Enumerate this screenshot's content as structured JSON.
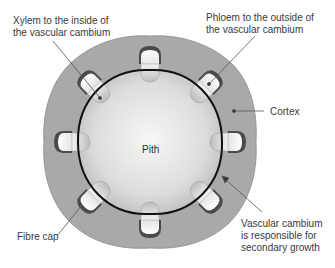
{
  "diagram": {
    "labels": {
      "xylem": [
        "Xylem to the inside of",
        "the vascular cambium"
      ],
      "phloem": [
        "Phloem to the outside of",
        "the vascular cambium"
      ],
      "cortex": "Cortex",
      "pith": "Pith",
      "cambium": [
        "Vascular cambium",
        "is responsible for",
        "secondary growth"
      ],
      "fibre_cap": "Fibre cap"
    },
    "colors": {
      "cortex": "#a9a9a9",
      "pith_center": "#f4f4f4",
      "pith_edge": "#b8b8b8",
      "cambium_ring": "#111111",
      "fibre_cap": "#4a4a4a",
      "phloem": "#f2f2f2",
      "xylem": "#d0d0d0",
      "leader": "#555555"
    },
    "vascular_bundle_count": 8
  }
}
